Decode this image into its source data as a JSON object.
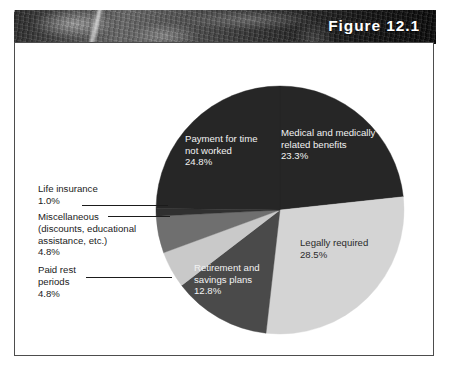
{
  "figure": {
    "title": "Figure 12.1"
  },
  "chart_data": {
    "type": "pie",
    "title": "Figure 12.1",
    "xlabel": "",
    "ylabel": "",
    "legend_position": "none",
    "grid": false,
    "value_unit": "percent",
    "start_angle_deg": -90,
    "direction": "clockwise",
    "slices": [
      {
        "label": "Medical and medically\nrelated benefits",
        "name": "Medical and medically related benefits",
        "value": 23.3,
        "value_label": "23.3%",
        "color": "#262626",
        "label_placement": "inside"
      },
      {
        "label": "Legally required",
        "name": "Legally required",
        "value": 28.5,
        "value_label": "28.5%",
        "color": "#d4d4d4",
        "label_placement": "inside"
      },
      {
        "label": "Retirement and\nsavings plans",
        "name": "Retirement and savings plans",
        "value": 12.8,
        "value_label": "12.8%",
        "color": "#4a4a4a",
        "label_placement": "inside"
      },
      {
        "label": "Paid rest\nperiods",
        "name": "Paid rest periods",
        "value": 4.8,
        "value_label": "4.8%",
        "color": "#c9c9c9",
        "label_placement": "outside"
      },
      {
        "label": "Miscellaneous\n(discounts, educational\nassistance, etc.)",
        "name": "Miscellaneous (discounts, educational assistance, etc.)",
        "value": 4.8,
        "value_label": "4.8%",
        "color": "#6f6f6f",
        "label_placement": "outside"
      },
      {
        "label": "Life insurance",
        "name": "Life insurance",
        "value": 1.0,
        "value_label": "1.0%",
        "color": "#303030",
        "label_placement": "outside"
      },
      {
        "label": "Payment for time\nnot worked",
        "name": "Payment for time not worked",
        "value": 24.8,
        "value_label": "24.8%",
        "color": "#262626",
        "label_placement": "inside"
      }
    ],
    "inside_labels": [
      {
        "text": "Payment for time\nnot worked\n24.8%"
      },
      {
        "text": "Medical and medically\nrelated benefits\n23.3%"
      },
      {
        "text": "Legally required\n28.5%"
      },
      {
        "text": "Retirement and\nsavings plans\n12.8%"
      }
    ],
    "outside_labels": [
      {
        "text": "Life insurance\n1.0%"
      },
      {
        "text": "Miscellaneous\n(discounts, educational\nassistance, etc.)\n4.8%"
      },
      {
        "text": "Paid rest\nperiods\n4.8%"
      }
    ]
  },
  "colors": {
    "panel_border": "#4d4d4d",
    "background": "#ffffff",
    "dark_slice": "#262626",
    "light_slice": "#d4d4d4",
    "mid_dark_slice": "#4a4a4a",
    "mid_slice": "#6f6f6f",
    "pale_slice": "#c9c9c9",
    "title_text": "#ffffff",
    "label_text_dark": "#1b1b1b",
    "label_text_light": "#f2f2f2"
  }
}
